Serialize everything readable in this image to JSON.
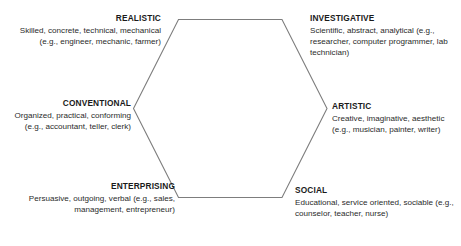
{
  "diagram": {
    "name": "holland-riasec-hexagon",
    "shape": "hexagon",
    "stroke_color": "#7d7d7d",
    "text_color": "#1a1a1a",
    "background_color": "#ffffff",
    "types": [
      {
        "id": "realistic",
        "title": "REALISTIC",
        "description": "Skilled, concrete, technical, mechanical (e.g., engineer, mechanic, farmer)",
        "align": "right",
        "position": "top-left"
      },
      {
        "id": "investigative",
        "title": "INVESTIGATIVE",
        "description": "Scientific, abstract, analytical (e.g., researcher, computer programmer, lab technician)",
        "align": "left",
        "position": "top-right"
      },
      {
        "id": "conventional",
        "title": "CONVENTIONAL",
        "description": "Organized, practical, conforming (e.g., accountant, teller, clerk)",
        "align": "right",
        "position": "middle-left"
      },
      {
        "id": "artistic",
        "title": "ARTISTIC",
        "description": "Creative, imaginative, aesthetic (e.g., musician, painter, writer)",
        "align": "left",
        "position": "middle-right"
      },
      {
        "id": "enterprising",
        "title": "ENTERPRISING",
        "description": "Persuasive, outgoing, verbal (e.g., sales, management, entrepreneur)",
        "align": "right",
        "position": "bottom-left"
      },
      {
        "id": "social",
        "title": "SOCIAL",
        "description": "Educational, service oriented, sociable (e.g., counselor, teacher, nurse)",
        "align": "left",
        "position": "bottom-right"
      }
    ]
  }
}
